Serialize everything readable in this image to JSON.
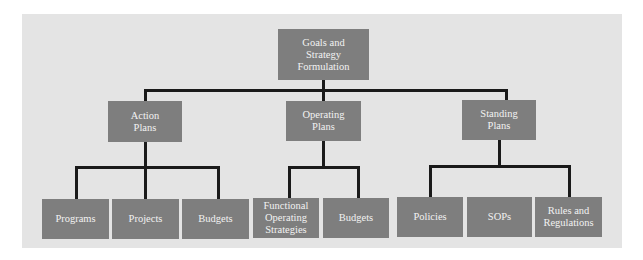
{
  "diagram": {
    "root": {
      "label": "Goals and\nStrategy\nFormulation"
    },
    "branches": [
      {
        "label": "Action\nPlans",
        "children": [
          "Programs",
          "Projects",
          "Budgets"
        ]
      },
      {
        "label": "Operating\nPlans",
        "children": [
          "Functional\nOperating\nStrategies",
          "Budgets"
        ]
      },
      {
        "label": "Standing\nPlans",
        "children": [
          "Policies",
          "SOPs",
          "Rules and\nRegulations"
        ]
      }
    ]
  },
  "colors": {
    "panel_background": "#e4e4e4",
    "box_fill": "#7e7e7e",
    "box_text": "#f2f2f2",
    "connector": "#1a1a1a"
  }
}
